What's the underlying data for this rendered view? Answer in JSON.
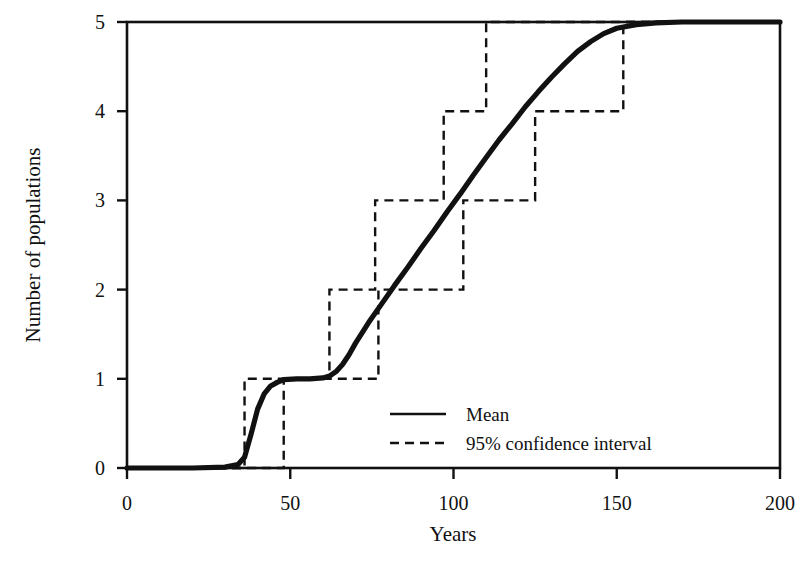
{
  "chart_data": {
    "type": "line",
    "title": "",
    "xlabel": "Years",
    "ylabel": "Number of populations",
    "xlim": [
      0,
      200
    ],
    "ylim": [
      0,
      5
    ],
    "xticks": [
      0,
      50,
      100,
      150,
      200
    ],
    "yticks": [
      0,
      1,
      2,
      3,
      4,
      5
    ],
    "xtick_labels": [
      "0",
      "50",
      "100",
      "150",
      "200"
    ],
    "ytick_labels": [
      "0",
      "1",
      "2",
      "3",
      "4",
      "5"
    ],
    "grid": false,
    "legend_position": "center-right-inside",
    "series": [
      {
        "name": "Mean",
        "style": "solid",
        "color": "#111111",
        "description": "Smooth sigmoidal cumulative curve rising from 0 populations to 5 populations",
        "x": [
          0,
          10,
          20,
          30,
          34,
          36,
          38,
          40,
          42,
          44,
          46,
          48,
          52,
          56,
          60,
          62,
          64,
          66,
          68,
          70,
          74,
          78,
          82,
          86,
          90,
          94,
          98,
          102,
          106,
          110,
          114,
          118,
          122,
          126,
          130,
          134,
          138,
          142,
          146,
          150,
          156,
          162,
          170,
          180,
          190,
          200
        ],
        "y": [
          0.0,
          0.0,
          0.0,
          0.01,
          0.04,
          0.12,
          0.38,
          0.66,
          0.83,
          0.92,
          0.96,
          0.99,
          1.0,
          1.0,
          1.01,
          1.03,
          1.08,
          1.16,
          1.27,
          1.4,
          1.63,
          1.84,
          2.05,
          2.25,
          2.46,
          2.66,
          2.87,
          3.07,
          3.28,
          3.48,
          3.68,
          3.86,
          4.05,
          4.22,
          4.38,
          4.53,
          4.67,
          4.78,
          4.87,
          4.93,
          4.97,
          4.99,
          5.0,
          5.0,
          5.0,
          5.0
        ]
      },
      {
        "name": "95% confidence interval",
        "style": "dashed",
        "color": "#111111",
        "description": "Two dashed step functions bracketing the mean curve",
        "upper_steps": [
          {
            "x_start": 0,
            "x_end": 36,
            "y": 0
          },
          {
            "x_start": 36,
            "x_end": 62,
            "y": 1
          },
          {
            "x_start": 62,
            "x_end": 76,
            "y": 2
          },
          {
            "x_start": 76,
            "x_end": 97,
            "y": 3
          },
          {
            "x_start": 97,
            "x_end": 110,
            "y": 4
          },
          {
            "x_start": 110,
            "x_end": 200,
            "y": 5
          }
        ],
        "lower_steps": [
          {
            "x_start": 0,
            "x_end": 48,
            "y": 0
          },
          {
            "x_start": 48,
            "x_end": 77,
            "y": 1
          },
          {
            "x_start": 77,
            "x_end": 103,
            "y": 2
          },
          {
            "x_start": 103,
            "x_end": 125,
            "y": 3
          },
          {
            "x_start": 125,
            "x_end": 152,
            "y": 4
          },
          {
            "x_start": 152,
            "x_end": 200,
            "y": 5
          }
        ]
      }
    ],
    "legend_entries": [
      {
        "label": "Mean",
        "style": "solid"
      },
      {
        "label": "95% confidence interval",
        "style": "dashed"
      }
    ]
  },
  "axes": {
    "x_title": "Years",
    "y_title": "Number of populations",
    "x_tick_labels": [
      "0",
      "50",
      "100",
      "150",
      "200"
    ],
    "y_tick_labels": [
      "0",
      "1",
      "2",
      "3",
      "4",
      "5"
    ]
  },
  "legend": {
    "mean_label": "Mean",
    "ci_label": "95% confidence interval"
  },
  "style": {
    "ink": "#111111",
    "background": "#ffffff"
  }
}
